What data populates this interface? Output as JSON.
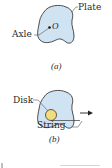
{
  "figure": {
    "panel_a": {
      "caption": "(a)",
      "labels": {
        "plate": "Plate",
        "axle": "Axle",
        "point": "O"
      }
    },
    "panel_b": {
      "caption": "(b)",
      "labels": {
        "disk": "Disk",
        "string": "String"
      }
    },
    "colors": {
      "plate_fill": "#cfe3f3",
      "outline": "#3a3a3a",
      "disk_fill": "#f5dc7a",
      "text": "#2a2a2a"
    }
  }
}
